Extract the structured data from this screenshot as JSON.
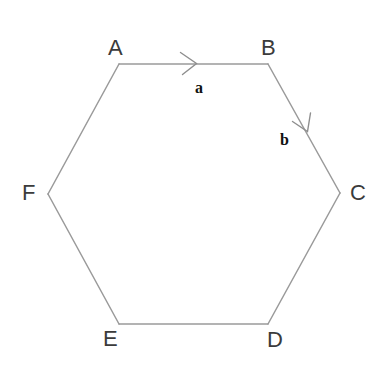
{
  "figure": {
    "kind": "geometry-diagram",
    "shape_name": "regular-hexagon",
    "background_color": "#ffffff",
    "stroke_color": "#9a9a9a",
    "arrow_color": "#8e8e8e",
    "vertex_label_color": "#3b3b3b",
    "vector_label_color": "#111111",
    "width": 383,
    "height": 374
  },
  "vertices": [
    {
      "id": "A",
      "label": "A",
      "x": 119,
      "y": 64
    },
    {
      "id": "B",
      "label": "B",
      "x": 268,
      "y": 64
    },
    {
      "id": "C",
      "label": "C",
      "x": 340,
      "y": 193
    },
    {
      "id": "D",
      "label": "D",
      "x": 268,
      "y": 324
    },
    {
      "id": "E",
      "label": "E",
      "x": 119,
      "y": 324
    },
    {
      "id": "F",
      "label": "F",
      "x": 48,
      "y": 194
    }
  ],
  "edges": [
    {
      "id": "AB",
      "from": "A",
      "to": "B"
    },
    {
      "id": "BC",
      "from": "B",
      "to": "C"
    },
    {
      "id": "CD",
      "from": "C",
      "to": "D"
    },
    {
      "id": "DE",
      "from": "D",
      "to": "E"
    },
    {
      "id": "EF",
      "from": "E",
      "to": "F"
    },
    {
      "id": "FA",
      "from": "F",
      "to": "A"
    }
  ],
  "vectors": [
    {
      "id": "a",
      "label": "a",
      "on_edge": "AB",
      "direction": "A-to-B",
      "marker_x": 193,
      "marker_y": 63,
      "label_x": 200,
      "label_y": 87
    },
    {
      "id": "b",
      "label": "b",
      "on_edge": "BC",
      "direction": "B-to-C",
      "marker_x": 305,
      "marker_y": 126,
      "label_x": 287,
      "label_y": 140
    }
  ],
  "chart_data": {
    "type": "diagram",
    "title": "",
    "polygon_order": [
      "A",
      "B",
      "C",
      "D",
      "E",
      "F"
    ],
    "points": {
      "A": [
        119,
        64
      ],
      "B": [
        268,
        64
      ],
      "C": [
        340,
        193
      ],
      "D": [
        268,
        324
      ],
      "E": [
        119,
        324
      ],
      "F": [
        48,
        194
      ]
    },
    "annotations": [
      {
        "text": "a",
        "type": "vector-label",
        "edge": "AB"
      },
      {
        "text": "b",
        "type": "vector-label",
        "edge": "BC"
      }
    ],
    "grid": false,
    "legend": "none"
  }
}
